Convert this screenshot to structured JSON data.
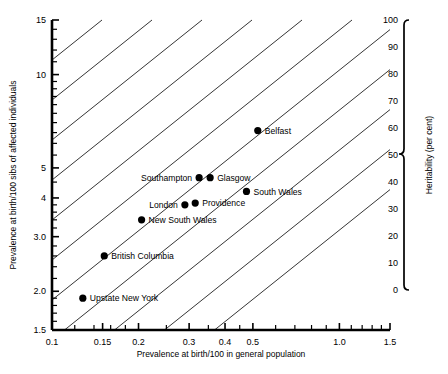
{
  "chart_data": {
    "type": "scatter",
    "title": "",
    "xlabel": "Prevalence at birth/100 in general population",
    "ylabel": "Prevalence at birth/100 sibs of affected individuals",
    "y2label": "Heritability (per cent)",
    "xscale": "log",
    "yscale": "log",
    "xlim": [
      0.1,
      1.5
    ],
    "ylim": [
      1.5,
      15
    ],
    "y2lim": [
      0,
      100
    ],
    "grid": false,
    "legend": "none",
    "xticks": [
      "0.1",
      "0.15",
      "0.2",
      "0.3",
      "0.4",
      "0.5",
      "1.0",
      "1.5"
    ],
    "xtickvalues": [
      0.1,
      0.15,
      0.2,
      0.3,
      0.4,
      0.5,
      1.0,
      1.5
    ],
    "yticks": [
      "1.5",
      "2.0",
      "3.0",
      "4",
      "5",
      "10",
      "15"
    ],
    "ytickvalues": [
      1.5,
      2.0,
      3.0,
      4,
      5,
      10,
      15
    ],
    "y2ticks": [
      "0",
      "10",
      "20",
      "30",
      "40",
      "50",
      "60",
      "70",
      "80",
      "90",
      "100"
    ],
    "y2tickvalues": [
      0,
      10,
      20,
      30,
      40,
      50,
      60,
      70,
      80,
      90,
      100
    ],
    "points": [
      {
        "label": "Belfast",
        "x": 0.52,
        "y": 6.6,
        "label_side": "right"
      },
      {
        "label": "Southampton",
        "x": 0.325,
        "y": 4.65,
        "label_side": "left"
      },
      {
        "label": "Glasgow",
        "x": 0.355,
        "y": 4.65,
        "label_side": "right"
      },
      {
        "label": "South Wales",
        "x": 0.475,
        "y": 4.2,
        "label_side": "right"
      },
      {
        "label": "London",
        "x": 0.29,
        "y": 3.8,
        "label_side": "left"
      },
      {
        "label": "Providence",
        "x": 0.315,
        "y": 3.85,
        "label_side": "right"
      },
      {
        "label": "New South Wales",
        "x": 0.205,
        "y": 3.4,
        "label_side": "right"
      },
      {
        "label": "British Columbia",
        "x": 0.152,
        "y": 2.6,
        "label_side": "right"
      },
      {
        "label": "Upstate New York",
        "x": 0.128,
        "y": 1.9,
        "label_side": "right"
      }
    ],
    "heritability_lines": 11
  },
  "colors": {
    "background": "#ffffff",
    "axis": "#000000",
    "marker": "#000000",
    "heritability_line": "#111111"
  }
}
